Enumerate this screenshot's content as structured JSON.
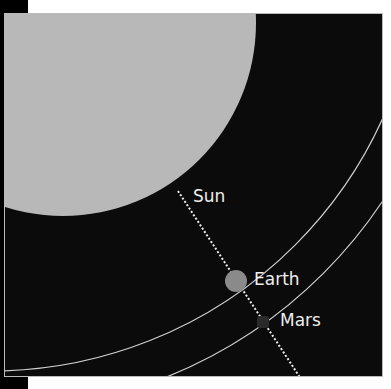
{
  "diagram": {
    "labels": {
      "sun": "Sun",
      "earth": "Earth",
      "mars": "Mars"
    },
    "colors": {
      "background": "#0b0b0b",
      "sun": "#b8b8b8",
      "earth": "#8a8a8a",
      "mars": "#2a2a2a",
      "orbit": "#cfcfcf"
    }
  }
}
